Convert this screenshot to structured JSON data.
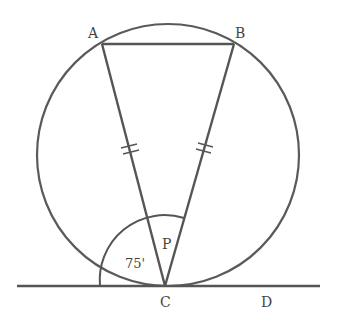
{
  "diagram": {
    "type": "circle-geometry",
    "colors": {
      "stroke": "#555555",
      "text": "#444444",
      "background": "#ffffff"
    },
    "circle": {
      "cx": 168,
      "cy": 155,
      "r": 130
    },
    "points": {
      "A": {
        "label": "A",
        "x": 102,
        "y": 44
      },
      "B": {
        "label": "B",
        "x": 234,
        "y": 44
      },
      "C": {
        "label": "C",
        "x": 165,
        "y": 286
      },
      "D": {
        "label": "D",
        "x": 265,
        "y": 286
      }
    },
    "segments": [
      "AB",
      "AC",
      "BC"
    ],
    "tangent_line": {
      "through": "C",
      "x1": 17,
      "x2": 320,
      "y": 286,
      "end_label": "D"
    },
    "equal_marks": [
      "AC",
      "BC"
    ],
    "angles": [
      {
        "label": "75'",
        "description": "angle between tangent (left) and chord CA"
      },
      {
        "label": "P",
        "description": "angle ACB at C"
      }
    ]
  }
}
